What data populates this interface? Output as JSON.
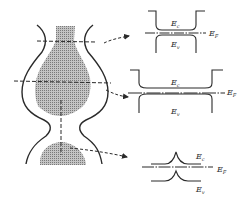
{
  "diagram": {
    "type": "band-diagram-of-constricted-nanowire",
    "colors": {
      "ink": "#2a2a2a",
      "shade": "#a8a8a8",
      "background": "#ffffff"
    },
    "bands": [
      {
        "id": "top-neck",
        "labels": {
          "conduction": "Ec",
          "valence": "Ev",
          "fermi": "EF"
        }
      },
      {
        "id": "middle-bulge",
        "labels": {
          "conduction": "Ec",
          "valence": "Ev",
          "fermi": "EF"
        }
      },
      {
        "id": "bottom-constriction",
        "labels": {
          "conduction": "Ec",
          "valence": "Ev",
          "fermi": "EF"
        }
      }
    ]
  }
}
